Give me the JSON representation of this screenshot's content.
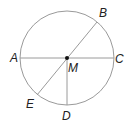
{
  "diagram": {
    "type": "circle-geometry",
    "center": {
      "label": "M",
      "x": 67,
      "y": 58
    },
    "radius": 47,
    "points": {
      "A": {
        "label": "A",
        "x": 20,
        "y": 58
      },
      "B": {
        "label": "B",
        "x": 97,
        "y": 22
      },
      "C": {
        "label": "C",
        "x": 114,
        "y": 58
      },
      "D": {
        "label": "D",
        "x": 67,
        "y": 105
      },
      "E": {
        "label": "E",
        "x": 37,
        "y": 95
      }
    },
    "segments": [
      "AC",
      "BE",
      "MD"
    ],
    "colors": {
      "line": "#9a9a9a",
      "text": "#222222",
      "point": "#111111"
    }
  }
}
